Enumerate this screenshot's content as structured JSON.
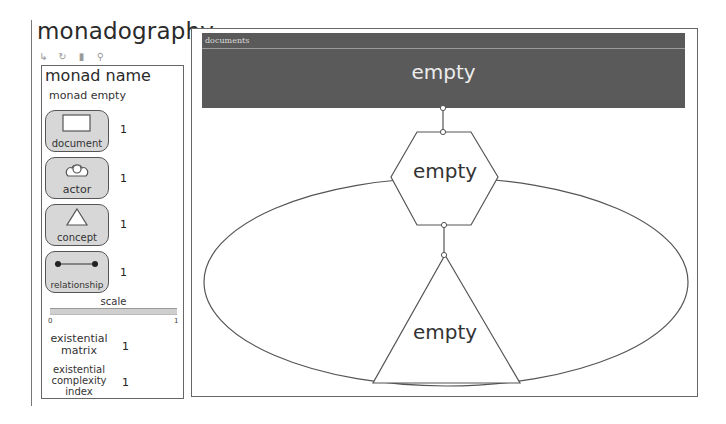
{
  "app": {
    "title": "monadography"
  },
  "toolbar": {
    "items": [
      {
        "name": "new-icon",
        "glyph": "↳"
      },
      {
        "name": "redo-icon",
        "glyph": "↻"
      },
      {
        "name": "trash-icon",
        "glyph": "▮"
      },
      {
        "name": "search-icon",
        "glyph": "⚲"
      }
    ]
  },
  "sidebar": {
    "title": "monad name",
    "subtitle": "monad empty",
    "palette": [
      {
        "label": "document",
        "icon": "rectangle-icon",
        "count": "1"
      },
      {
        "label": "actor",
        "icon": "actor-icon",
        "count": "1"
      },
      {
        "label": "concept",
        "icon": "triangle-icon",
        "count": "1"
      },
      {
        "label": "relationship",
        "icon": "relationship-icon",
        "count": "1"
      }
    ],
    "scale": {
      "label": "scale",
      "min": "0",
      "max": "1"
    },
    "metrics": [
      {
        "label_lines": [
          "existential",
          "matrix"
        ],
        "value": "1"
      },
      {
        "label_lines": [
          "existential",
          "complexity",
          "index"
        ],
        "value": "1"
      }
    ]
  },
  "canvas": {
    "documents_band": {
      "label": "documents",
      "text": "empty"
    },
    "hexagon": {
      "text": "empty"
    },
    "triangle": {
      "text": "empty"
    },
    "colors": {
      "band": "#5a5a5a",
      "stroke": "#555555",
      "background": "#ffffff"
    }
  }
}
